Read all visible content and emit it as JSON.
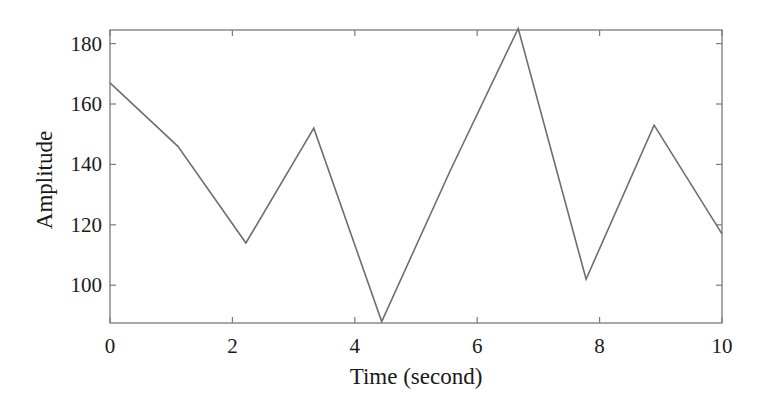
{
  "chart_data": {
    "type": "line",
    "title": "",
    "xlabel": "Time (second)",
    "ylabel": "Amplitude",
    "xlim": [
      0,
      10
    ],
    "ylim": [
      87.5,
      184.5
    ],
    "xticks": [
      0,
      2,
      4,
      6,
      8,
      10
    ],
    "yticks": [
      100,
      120,
      140,
      160,
      180
    ],
    "xtick_labels": [
      "0",
      "2",
      "4",
      "6",
      "8",
      "10"
    ],
    "ytick_labels": [
      "100",
      "120",
      "140",
      "160",
      "180"
    ],
    "grid": false,
    "legend": null,
    "series": [
      {
        "name": "signal",
        "color": "#6e6e6e",
        "x": [
          0,
          1.11,
          2.22,
          3.33,
          4.44,
          5.56,
          6.67,
          7.78,
          8.89,
          10
        ],
        "y": [
          167,
          146,
          114,
          152,
          88,
          138,
          185,
          102,
          153,
          117
        ]
      }
    ]
  },
  "layout": {
    "plot_left": 110,
    "plot_right": 722,
    "plot_top": 30,
    "plot_bottom": 323,
    "frame_color": "#7a7a7a",
    "line_color": "#6e6e6e"
  }
}
